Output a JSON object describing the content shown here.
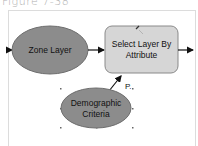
{
  "caption": "Figure 7-38",
  "diagram": {
    "nodes": [
      {
        "id": "zone-layer",
        "label": "Zone Layer",
        "shape": "ellipse",
        "fill": "#8c8c8c"
      },
      {
        "id": "select-layer-by-attribute",
        "label_line1": "Select Layer By",
        "label_line2": "Attribute",
        "shape": "rounded-rect",
        "fill": "#d6d6d6"
      },
      {
        "id": "demographic-criteria",
        "label_line1": "Demographic",
        "label_line2": "Criteria",
        "shape": "ellipse",
        "fill": "#8c8c8c"
      }
    ],
    "edges": [
      {
        "from": "input",
        "to": "zone-layer"
      },
      {
        "from": "zone-layer",
        "to": "select-layer-by-attribute"
      },
      {
        "from": "demographic-criteria",
        "to": "select-layer-by-attribute",
        "label": "P."
      },
      {
        "from": "select-layer-by-attribute",
        "to": "output"
      }
    ],
    "parameter_label": "P."
  },
  "colors": {
    "ellipse_fill": "#8c8c8c",
    "rect_fill": "#d6d6d6",
    "stroke": "#555555",
    "arrow": "#111111"
  }
}
